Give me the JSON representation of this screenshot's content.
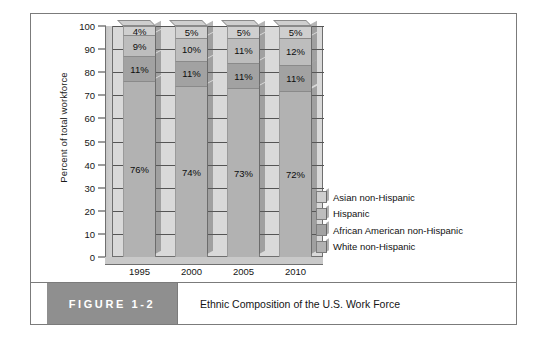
{
  "figure": {
    "tag": "FIGURE 1-2",
    "caption": "Ethnic Composition of the U.S. Work Force"
  },
  "legend": {
    "items": [
      {
        "label": "Asian non-Hispanic",
        "color": "#cfcfcf"
      },
      {
        "label": "Hispanic",
        "color": "#bdbdbd"
      },
      {
        "label": "African American non-Hispanic",
        "color": "#a2a2a2"
      },
      {
        "label": "White non-Hispanic",
        "color": "#b2b2b2"
      }
    ]
  },
  "chart_data": {
    "type": "bar",
    "stacked": true,
    "title": "Ethnic Composition of the U.S. Work Force",
    "xlabel": "",
    "ylabel": "Percent of total workforce",
    "categories": [
      "1995",
      "2000",
      "2005",
      "2010"
    ],
    "ylim": [
      0,
      100
    ],
    "yticks": [
      0,
      10,
      20,
      30,
      40,
      50,
      60,
      70,
      80,
      90,
      100
    ],
    "grid": true,
    "legend_position": "right",
    "series": [
      {
        "name": "White non-Hispanic",
        "color": "#b2b2b2",
        "values": [
          76,
          74,
          73,
          72
        ],
        "labels": [
          "76%",
          "74%",
          "73%",
          "72%"
        ]
      },
      {
        "name": "African American non-Hispanic",
        "color": "#a2a2a2",
        "values": [
          11,
          11,
          11,
          11
        ],
        "labels": [
          "11%",
          "11%",
          "11%",
          "11%"
        ]
      },
      {
        "name": "Hispanic",
        "color": "#bdbdbd",
        "values": [
          9,
          10,
          11,
          12
        ],
        "labels": [
          "9%",
          "10%",
          "11%",
          "12%"
        ]
      },
      {
        "name": "Asian non-Hispanic",
        "color": "#cfcfcf",
        "values": [
          4,
          5,
          5,
          5
        ],
        "labels": [
          "4%",
          "5%",
          "5%",
          "5%"
        ]
      }
    ]
  }
}
